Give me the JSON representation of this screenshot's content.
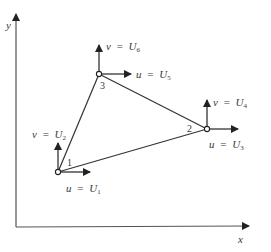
{
  "diagram": {
    "axes": {
      "x_label": "x",
      "y_label": "y"
    },
    "nodes": [
      {
        "id": "1",
        "label": "1",
        "u_label": "u",
        "u_value": "U",
        "u_sub": "1",
        "v_label": "v",
        "v_value": "U",
        "v_sub": "2"
      },
      {
        "id": "2",
        "label": "2",
        "u_label": "u",
        "u_value": "U",
        "u_sub": "3",
        "v_label": "v",
        "v_value": "U",
        "v_sub": "4"
      },
      {
        "id": "3",
        "label": "3",
        "u_label": "u",
        "u_value": "U",
        "u_sub": "5",
        "v_label": "v",
        "v_value": "U",
        "v_sub": "6"
      }
    ],
    "equals": "=",
    "colors": {
      "line": "#333333",
      "text": "#3a3a3a",
      "background": "#ffffff"
    }
  }
}
